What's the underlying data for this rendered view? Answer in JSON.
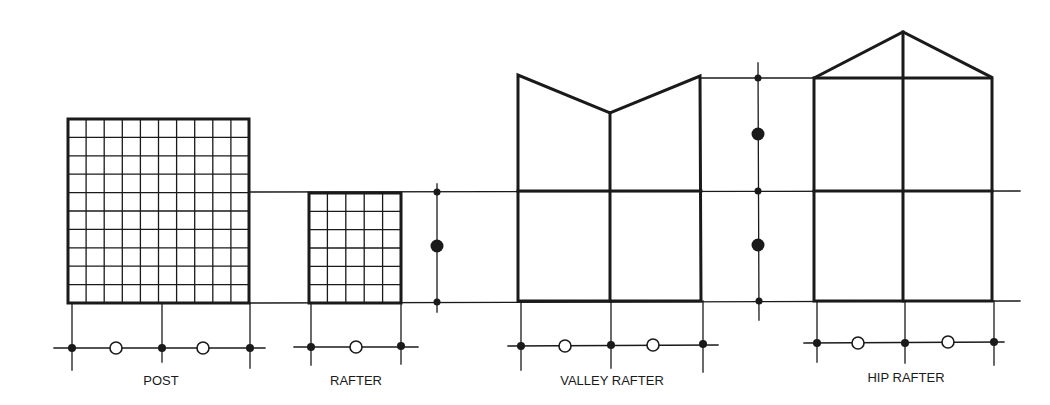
{
  "diagram": {
    "colors": {
      "ink": "#1a1a1a",
      "background": "#ffffff"
    },
    "labels": {
      "post": "POST",
      "rafter": "RAFTER",
      "valley_rafter": "VALLEY RAFTER",
      "hip_rafter": "HIP RAFTER"
    },
    "post": {
      "grid_cols": 10,
      "grid_rows": 10
    },
    "rafter": {
      "grid_cols": 5,
      "grid_rows": 6
    },
    "legend_symbols": {
      "filled_dot": "filled-dot",
      "open_circle": "open-circle"
    }
  }
}
